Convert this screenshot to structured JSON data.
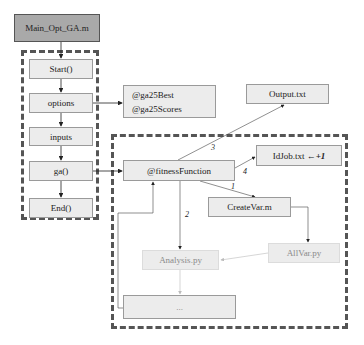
{
  "diagram": {
    "title_node": "Main_Opt_GA.m",
    "main_sequence": [
      {
        "id": "start",
        "label": "Start()"
      },
      {
        "id": "options",
        "label": "options"
      },
      {
        "id": "inputs",
        "label": "inputs"
      },
      {
        "id": "ga",
        "label": "ga()"
      },
      {
        "id": "end",
        "label": "End()"
      }
    ],
    "options_outputs": [
      "@ga25Best",
      "@ga25Scores"
    ],
    "fitness_function": "@fitnessFunction",
    "output_file": "Output.txt",
    "idjob": {
      "text": "IdJob.txt ← ",
      "increment": "+1"
    },
    "create_var": "CreateVar.m",
    "allvar": "AllVar.py",
    "analysis": "Analysis.py",
    "ellipsis": "...",
    "edge_labels": {
      "e1": "1",
      "e2": "2",
      "e3": "3",
      "e4": "4"
    },
    "colors": {
      "title_fill": "#a9a9a9",
      "node_fill": "#ececec",
      "dash": "#555555",
      "faded_text": "#8a8a8a"
    }
  }
}
